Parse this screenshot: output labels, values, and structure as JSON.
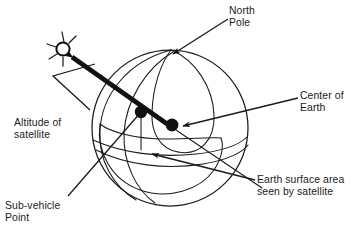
{
  "figure": {
    "background_color": "#ffffff",
    "ink_color": "#111111",
    "width": 363,
    "height": 236
  },
  "labels": {
    "north_pole": "North\nPole",
    "center_of_earth": "Center of\nEarth",
    "altitude_of_satellite": "Altitude of\nsatellite",
    "earth_surface_area": "Earth surface area\nseen by satellite",
    "sub_vehicle_point": "Sub-vehicle\nPoint"
  },
  "elements": {
    "earth_sphere": "globe-outline-circle",
    "meridians": "three-longitude-arcs",
    "equator": "latitude-arc",
    "orbit_path": "satellite-orbit-ellipse",
    "satellite": "satellite-body-with-antennas",
    "altitude_line": "double-headed-thick-arrow",
    "center_dot": "filled-circle-marker",
    "sub_vehicle_dot": "filled-circle-marker",
    "coverage_cap": "surface-area-cap-arc"
  }
}
